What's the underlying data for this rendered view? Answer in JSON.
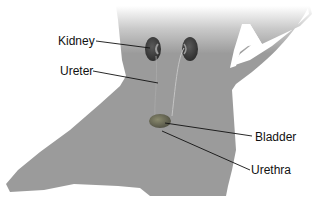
{
  "diagram": {
    "labels": [
      {
        "id": "kidney",
        "text": "Kidney"
      },
      {
        "id": "ureter",
        "text": "Ureter"
      },
      {
        "id": "bladder",
        "text": "Bladder"
      },
      {
        "id": "urethra",
        "text": "Urethra"
      }
    ],
    "colors": {
      "silhouette": "#9b9b9b",
      "organ": "#3e3e3e",
      "bladder": "#6a6a5a",
      "leader_line": "#111111"
    }
  }
}
